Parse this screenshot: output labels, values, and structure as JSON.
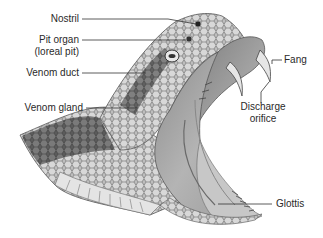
{
  "diagram": {
    "labels": [
      {
        "id": "nostril",
        "text": "Nostril"
      },
      {
        "id": "pit-organ",
        "text": "Pit organ",
        "text2": "(loreal pit)"
      },
      {
        "id": "venom-duct",
        "text": "Venom duct"
      },
      {
        "id": "venom-gland",
        "text": "Venom gland"
      },
      {
        "id": "fang",
        "text": "Fang"
      },
      {
        "id": "discharge-orifice",
        "text": "Discharge",
        "text2": "orifice"
      },
      {
        "id": "glottis",
        "text": "Glottis"
      }
    ]
  },
  "colors": {
    "background": "#ffffff",
    "label_text": "#2a2a2a",
    "leader_line": "#333333",
    "scale_dark": "#5a5a5a",
    "scale_light": "#c8c8c8",
    "mouth_interior": "#a9a9a9",
    "fang": "#e6e6e6"
  }
}
